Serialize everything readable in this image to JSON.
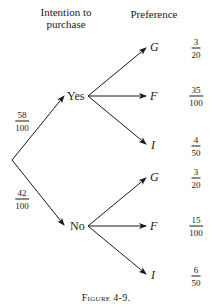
{
  "headers": {
    "intention_line1": "Intention to",
    "intention_line2": "purchase",
    "preference": "Preference"
  },
  "root_branches": [
    {
      "label": "Yes",
      "prob_num": "58",
      "prob_den": "100"
    },
    {
      "label": "No",
      "prob_num": "42",
      "prob_den": "100"
    }
  ],
  "yes_leaves": [
    {
      "label": "G",
      "num": "3",
      "den": "20"
    },
    {
      "label": "F",
      "num": "35",
      "den": "100"
    },
    {
      "label": "I",
      "num": "4",
      "den": "50"
    }
  ],
  "no_leaves": [
    {
      "label": "G",
      "num": "3",
      "den": "20"
    },
    {
      "label": "F",
      "num": "15",
      "den": "100"
    },
    {
      "label": "I",
      "num": "6",
      "den": "50"
    }
  ],
  "caption": "Figure 4-9.",
  "colors": {
    "ink": "#1a1a1a",
    "background": "#ffffff"
  }
}
